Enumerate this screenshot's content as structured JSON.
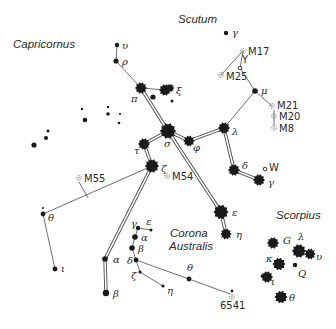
{
  "constellations": [
    {
      "name": "Capricornus",
      "x": 13,
      "y": 48
    },
    {
      "name": "Scutum",
      "x": 178,
      "y": 23
    },
    {
      "name": "Corona",
      "x": 170,
      "y": 237
    },
    {
      "name": "Australis",
      "x": 169,
      "y": 250
    },
    {
      "name": "Scorpius",
      "x": 276,
      "y": 219
    }
  ],
  "stars": [
    {
      "id": "upsilon-sgr",
      "label": "υ",
      "x": 117,
      "y": 45,
      "r": 2.2,
      "lx": 122,
      "ly": 49,
      "type": "dot"
    },
    {
      "id": "rho-sgr",
      "label": "ρ",
      "x": 116,
      "y": 61,
      "r": 2.6,
      "lx": 122,
      "ly": 65,
      "type": "dot"
    },
    {
      "id": "pi-sgr",
      "label": "π",
      "x": 141,
      "y": 88,
      "r": 4.5,
      "lx": 131,
      "ly": 102,
      "type": "burst"
    },
    {
      "id": "omicron-sgr",
      "label": "",
      "x": 165,
      "y": 90,
      "r": 4.5,
      "type": "burst"
    },
    {
      "id": "xi-sgr",
      "label": "ξ",
      "x": 170,
      "y": 88,
      "r": 3,
      "lx": 176,
      "ly": 94,
      "type": "burst"
    },
    {
      "id": "xi2-sgr",
      "label": "",
      "x": 172,
      "y": 101,
      "r": 1.5,
      "type": "dot"
    },
    {
      "id": "star-153-97",
      "label": "",
      "x": 153,
      "y": 97,
      "r": 2.6,
      "type": "dot"
    },
    {
      "id": "gamma-sct",
      "label": "γ",
      "x": 226,
      "y": 33,
      "r": 2.2,
      "lx": 232,
      "ly": 36,
      "type": "dot"
    },
    {
      "id": "mu-sgr",
      "label": "μ",
      "x": 255,
      "y": 91,
      "r": 2.8,
      "lx": 261,
      "ly": 94,
      "type": "dot"
    },
    {
      "id": "sigma-sgr",
      "label": "σ",
      "x": 168,
      "y": 131,
      "r": 6.5,
      "lx": 164,
      "ly": 147,
      "type": "burst"
    },
    {
      "id": "phi-sgr",
      "label": "φ",
      "x": 189,
      "y": 141,
      "r": 4.2,
      "lx": 193,
      "ly": 151,
      "type": "burst"
    },
    {
      "id": "lambda-sgr",
      "label": "λ",
      "x": 224,
      "y": 128,
      "r": 4.5,
      "lx": 232,
      "ly": 135,
      "type": "burst"
    },
    {
      "id": "tau-sgr",
      "label": "τ",
      "x": 144,
      "y": 144,
      "r": 4.5,
      "lx": 134,
      "ly": 154,
      "type": "burst"
    },
    {
      "id": "zeta-sgr",
      "label": "ζ",
      "x": 152,
      "y": 166,
      "r": 5.5,
      "lx": 161,
      "ly": 172,
      "type": "burst"
    },
    {
      "id": "delta-sgr",
      "label": "δ",
      "x": 234,
      "y": 170,
      "r": 4.5,
      "lx": 242,
      "ly": 169,
      "type": "burst"
    },
    {
      "id": "gamma-sgr",
      "label": "γ",
      "x": 259,
      "y": 180,
      "r": 4.5,
      "lx": 268,
      "ly": 186,
      "type": "burst"
    },
    {
      "id": "epsilon-sgr",
      "label": "ε",
      "x": 221,
      "y": 212,
      "r": 6,
      "lx": 232,
      "ly": 216,
      "type": "burst"
    },
    {
      "id": "eta-sgr",
      "label": "η",
      "x": 226,
      "y": 234,
      "r": 4.2,
      "lx": 236,
      "ly": 238,
      "type": "burst"
    },
    {
      "id": "alpha-sgr",
      "label": "α",
      "x": 105,
      "y": 259,
      "r": 2.8,
      "lx": 113,
      "ly": 263,
      "type": "dot"
    },
    {
      "id": "beta-sgr",
      "label": "β",
      "x": 106,
      "y": 293,
      "r": 3.2,
      "lx": 113,
      "ly": 297,
      "type": "dot"
    },
    {
      "id": "theta-cap",
      "label": "θ",
      "x": 43,
      "y": 214,
      "r": 2.4,
      "lx": 48,
      "ly": 221,
      "type": "dot"
    },
    {
      "id": "theta2-cap",
      "label": "",
      "x": 43,
      "y": 208,
      "r": 1,
      "type": "dot"
    },
    {
      "id": "iota-cap",
      "label": "ι",
      "x": 55,
      "y": 269,
      "r": 2.4,
      "lx": 61,
      "ly": 272,
      "type": "dot"
    },
    {
      "id": "gamma-cra",
      "label": "γ",
      "x": 138,
      "y": 228,
      "r": 2.2,
      "lx": 131,
      "ly": 227,
      "type": "dot"
    },
    {
      "id": "epsilon-cra",
      "label": "ε",
      "x": 151,
      "y": 230,
      "r": 1.5,
      "lx": 146,
      "ly": 225,
      "type": "dot"
    },
    {
      "id": "alpha-cra",
      "label": "α",
      "x": 135,
      "y": 237,
      "r": 2.8,
      "lx": 141,
      "ly": 241,
      "type": "dot"
    },
    {
      "id": "beta-cra",
      "label": "β",
      "x": 132,
      "y": 248,
      "r": 2.8,
      "lx": 138,
      "ly": 252,
      "type": "dot"
    },
    {
      "id": "delta-cra",
      "label": "δ",
      "x": 136,
      "y": 260,
      "r": 2.4,
      "lx": 127,
      "ly": 264,
      "type": "dot"
    },
    {
      "id": "zeta-cra",
      "label": "ζ",
      "x": 140,
      "y": 272,
      "r": 1.6,
      "lx": 131,
      "ly": 279,
      "type": "dot"
    },
    {
      "id": "eta-cra",
      "label": "η",
      "x": 163,
      "y": 286,
      "r": 1.6,
      "lx": 167,
      "ly": 294,
      "type": "dot"
    },
    {
      "id": "theta-cra",
      "label": "θ",
      "x": 189,
      "y": 279,
      "r": 2.4,
      "lx": 187,
      "ly": 271,
      "type": "dot"
    },
    {
      "id": "ngc6541-star",
      "label": "",
      "x": 232,
      "y": 291,
      "r": 1.4,
      "type": "dot"
    },
    {
      "id": "g-sco",
      "label": "G",
      "x": 273,
      "y": 243,
      "r": 4.5,
      "lx": 283,
      "ly": 244,
      "type": "burst"
    },
    {
      "id": "lambda-sco",
      "label": "λ",
      "x": 299,
      "y": 251,
      "r": 5.5,
      "lx": 298,
      "ly": 240,
      "type": "burst"
    },
    {
      "id": "upsilon-sco",
      "label": "υ",
      "x": 310,
      "y": 254,
      "r": 4.2,
      "lx": 316,
      "ly": 260,
      "type": "burst"
    },
    {
      "id": "kappa-sco",
      "label": "κ",
      "x": 279,
      "y": 264,
      "r": 5,
      "lx": 266,
      "ly": 262,
      "type": "burst"
    },
    {
      "id": "q-sco",
      "label": "Q",
      "x": 295,
      "y": 265,
      "r": 2.2,
      "lx": 298,
      "ly": 277,
      "type": "dot"
    },
    {
      "id": "iota-sco",
      "label": "ι",
      "x": 267,
      "y": 277,
      "r": 4.5,
      "lx": 271,
      "ly": 285,
      "type": "burst"
    },
    {
      "id": "iota2-sco",
      "label": "",
      "x": 262,
      "y": 276,
      "r": 1.4,
      "type": "dot"
    },
    {
      "id": "theta-sco",
      "label": "θ",
      "x": 281,
      "y": 297,
      "r": 5,
      "lx": 289,
      "ly": 301,
      "type": "burst"
    }
  ],
  "field_stars": [
    {
      "x": 34,
      "y": 145,
      "r": 2.6
    },
    {
      "x": 46,
      "y": 138,
      "r": 2.1
    },
    {
      "x": 48,
      "y": 131,
      "r": 1.5
    },
    {
      "x": 82,
      "y": 109,
      "r": 1.2
    },
    {
      "x": 85,
      "y": 120,
      "r": 2.3
    },
    {
      "x": 108,
      "y": 107,
      "r": 1.2
    },
    {
      "x": 108,
      "y": 114,
      "r": 1.8
    },
    {
      "x": 119,
      "y": 123,
      "r": 1.3
    },
    {
      "x": 120,
      "y": 114,
      "r": 1.1
    }
  ],
  "deep_sky": [
    {
      "id": "M17",
      "label": "M17",
      "x": 243,
      "y": 51,
      "lx": 248,
      "ly": 55
    },
    {
      "id": "M25",
      "label": "M25",
      "x": 221,
      "y": 75,
      "lx": 226,
      "ly": 80
    },
    {
      "id": "M21",
      "label": "M21",
      "x": 272,
      "y": 106,
      "lx": 277,
      "ly": 109
    },
    {
      "id": "M20",
      "label": "M20",
      "x": 274,
      "y": 116,
      "lx": 279,
      "ly": 120
    },
    {
      "id": "M8",
      "label": "M8",
      "x": 274,
      "y": 128,
      "lx": 279,
      "ly": 132
    },
    {
      "id": "M55",
      "label": "M55",
      "x": 79,
      "y": 178,
      "lx": 84,
      "ly": 182
    },
    {
      "id": "M54",
      "label": "M54",
      "x": 167,
      "y": 176,
      "lx": 172,
      "ly": 180
    },
    {
      "id": "NGC6541",
      "label": "6541",
      "x": 232,
      "y": 297,
      "lx": 220,
      "ly": 309
    }
  ],
  "variable_stars": [
    {
      "id": "Y-sgr",
      "label": "Y",
      "x": 240,
      "y": 68,
      "lx": 242,
      "ly": 63
    },
    {
      "id": "W-sgr",
      "label": "W",
      "x": 265,
      "y": 169,
      "lx": 269,
      "ly": 171
    }
  ]
}
